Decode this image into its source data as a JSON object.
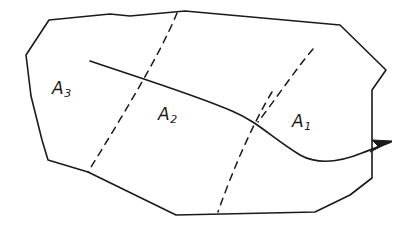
{
  "figure": {
    "kind": "region-partition-diagram",
    "background_color": "#ffffff",
    "stroke_color": "#1a1a1a",
    "boundary": {
      "name": "region-boundary",
      "stroke_width": 1.6,
      "style": "solid",
      "points": "49,20 26,55 31,96 42,140 48,160 88,172 176,215 315,212 350,195 372,178 372,90 386,70 340,25 185,11 130,16 110,14 49,20"
    },
    "dividers": [
      {
        "name": "divider-a3-a2",
        "style": "dashed",
        "stroke_width": 1.5,
        "dash": "7 6",
        "path": "M 177 13 C 160 55 120 120 88 172"
      },
      {
        "name": "divider-a2-a1",
        "style": "dashed",
        "stroke_width": 1.5,
        "dash": "7 6",
        "path": "M 272 92 C 252 125 232 172 218 212"
      },
      {
        "name": "divider-a1-upper",
        "style": "dashed",
        "stroke_width": 1.5,
        "dash": "7 6",
        "path": "M 313 49 C 296 69 275 100 258 122"
      }
    ],
    "flow_curve": {
      "name": "flow-curve-with-arrow",
      "style": "solid",
      "stroke_width": 1.7,
      "path": "M 90 61 C 140 78 195 95 232 111 C 258 122 272 138 300 155 C 318 165 340 162 362 153 C 375 148 384 145 391 142",
      "arrowhead": {
        "name": "arrowhead",
        "tip": "392,141",
        "points": "392,141 372,140 378,146 370,152"
      }
    },
    "labels": [
      {
        "id": "a3",
        "base": "A",
        "subscript": "3",
        "x": 52,
        "y": 80
      },
      {
        "id": "a2",
        "base": "A",
        "subscript": "2",
        "x": 158,
        "y": 106
      },
      {
        "id": "a1",
        "base": "A",
        "subscript": "1",
        "x": 292,
        "y": 113
      }
    ]
  }
}
